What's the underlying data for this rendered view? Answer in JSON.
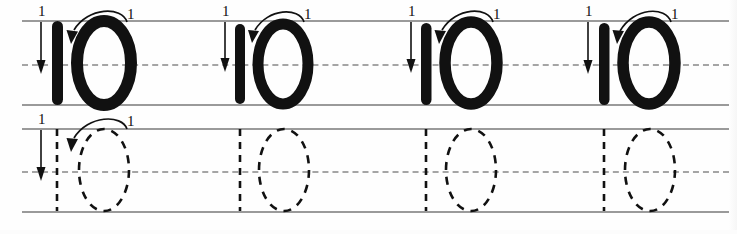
{
  "worksheet": {
    "title": "Number 10 tracing practice worksheet",
    "description": "Handwriting practice sheet for writing the number ten, with solid examples on the top line and dashed trace outlines on the bottom line.",
    "background_color": "#fefefe",
    "ink_color": "#111111",
    "guideline_color": "#9a9a9a",
    "midline_color": "#a5a5a5",
    "rows": [
      {
        "row_name": "solid-example-row",
        "style": "solid",
        "guides": {
          "top_label": "top line",
          "mid_label": "dashed midline",
          "base_label": "baseline"
        },
        "groups": [
          {
            "number": "10",
            "digits": [
              {
                "digit": "1",
                "stroke_label": "1",
                "arrow": "down-arrow"
              },
              {
                "digit": "0",
                "stroke_label": "1",
                "arrow": "counterclockwise-arc-arrow"
              }
            ]
          },
          {
            "number": "10",
            "digits": [
              {
                "digit": "1",
                "stroke_label": "1",
                "arrow": "down-arrow"
              },
              {
                "digit": "0",
                "stroke_label": "1",
                "arrow": "counterclockwise-arc-arrow"
              }
            ]
          },
          {
            "number": "10",
            "digits": [
              {
                "digit": "1",
                "stroke_label": "1",
                "arrow": "down-arrow"
              },
              {
                "digit": "0",
                "stroke_label": "1",
                "arrow": "counterclockwise-arc-arrow"
              }
            ]
          },
          {
            "number": "10",
            "digits": [
              {
                "digit": "1",
                "stroke_label": "1",
                "arrow": "down-arrow"
              },
              {
                "digit": "0",
                "stroke_label": "1",
                "arrow": "counterclockwise-arc-arrow"
              }
            ]
          }
        ]
      },
      {
        "row_name": "dashed-trace-row",
        "style": "dashed",
        "guides": {
          "top_label": "top line",
          "mid_label": "dashed midline",
          "base_label": "baseline"
        },
        "groups": [
          {
            "number": "10",
            "digits": [
              {
                "digit": "1",
                "stroke_label": "1",
                "arrow": "down-arrow"
              },
              {
                "digit": "0",
                "stroke_label": "1",
                "arrow": "counterclockwise-arc-arrow"
              }
            ]
          },
          {
            "number": "10",
            "digits": [
              {
                "digit": "1",
                "stroke_label": "",
                "arrow": ""
              },
              {
                "digit": "0",
                "stroke_label": "",
                "arrow": ""
              }
            ]
          },
          {
            "number": "10",
            "digits": [
              {
                "digit": "1",
                "stroke_label": "",
                "arrow": ""
              },
              {
                "digit": "0",
                "stroke_label": "",
                "arrow": ""
              }
            ]
          },
          {
            "number": "10",
            "digits": [
              {
                "digit": "1",
                "stroke_label": "",
                "arrow": ""
              },
              {
                "digit": "0",
                "stroke_label": "",
                "arrow": ""
              }
            ]
          }
        ]
      }
    ]
  }
}
